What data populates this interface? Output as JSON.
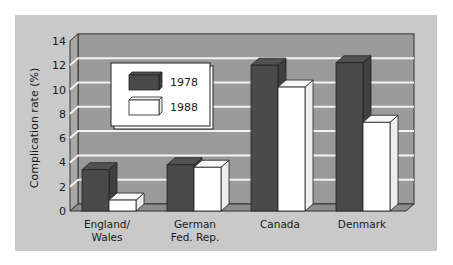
{
  "chart_data": {
    "type": "bar",
    "title": "",
    "xlabel": "",
    "ylabel": "Complication rate (%)",
    "ylim": [
      0,
      14
    ],
    "yticks": [
      0,
      2,
      4,
      6,
      8,
      10,
      12,
      14
    ],
    "grid": true,
    "categories": [
      {
        "line1": "England/",
        "line2": "Wales"
      },
      {
        "line1": "German",
        "line2": "Fed. Rep."
      },
      {
        "line1": "Canada",
        "line2": ""
      },
      {
        "line1": "Denmark",
        "line2": ""
      }
    ],
    "series": [
      {
        "name": "1978",
        "color": "#4a4a4a",
        "values": [
          3.4,
          3.8,
          12.0,
          12.2
        ]
      },
      {
        "name": "1988",
        "color": "#ffffff",
        "values": [
          0.9,
          3.6,
          10.2,
          7.3
        ]
      }
    ],
    "legend": {
      "position": "top-left",
      "entries": [
        "1978",
        "1988"
      ]
    },
    "colors": {
      "panel": "#c9c9c9",
      "wall": "#9a9a9a",
      "side_wall": "#a8a8a8",
      "floor": "#8c8c8c",
      "gridline": "#f2f2f2"
    }
  }
}
